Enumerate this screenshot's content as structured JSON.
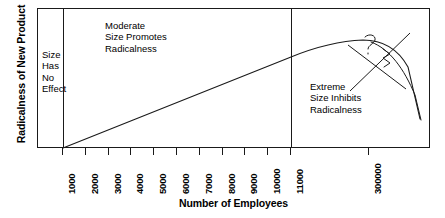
{
  "chart_data": {
    "type": "line",
    "title": "",
    "xlabel": "Number of Employees",
    "ylabel": "Radicalness of New Product",
    "grid": false,
    "legend": null,
    "x_tick_labels": [
      "1000",
      "2000",
      "3000",
      "4000",
      "5000",
      "6000",
      "7000",
      "8000",
      "9000",
      "10000",
      "11000",
      "300000"
    ],
    "y_tick_labels": [],
    "x_scale": "ordinal-break",
    "series": [
      {
        "name": "Radicalness vs firm size",
        "description": "Flat at zero below 1000 employees, rises linearly to a broad peak near 300000 employees, then falls steeply",
        "points": [
          {
            "x": "1000",
            "y": 0
          },
          {
            "x": "2000",
            "y": 8
          },
          {
            "x": "3000",
            "y": 17
          },
          {
            "x": "4000",
            "y": 26
          },
          {
            "x": "5000",
            "y": 35
          },
          {
            "x": "6000",
            "y": 43
          },
          {
            "x": "7000",
            "y": 52
          },
          {
            "x": "8000",
            "y": 61
          },
          {
            "x": "9000",
            "y": 70
          },
          {
            "x": "10000",
            "y": 78
          },
          {
            "x": "11000",
            "y": 84
          },
          {
            "x": "300000",
            "y": 92
          }
        ]
      }
    ],
    "regions": [
      {
        "id": "left",
        "boundary_low": null,
        "boundary_high": "1000",
        "label": "Size Has No Effect"
      },
      {
        "id": "mid",
        "boundary_low": "1000",
        "boundary_high": "11000",
        "label": "Moderate Size Promotes Radicalness"
      },
      {
        "id": "right",
        "boundary_low": "11000",
        "boundary_high": null,
        "label": "Extreme Size Inhibits Radicalness"
      }
    ],
    "annotations": [
      {
        "type": "question-mark",
        "text": "?",
        "note": "hand-drawn question mark near curve peak"
      },
      {
        "type": "cross-out",
        "text": "",
        "note": "two crossing hand-drawn diagonal strokes over the descending branch"
      }
    ]
  },
  "axes": {
    "y_title": "Radicalness of New Product",
    "x_title": "Number of Employees"
  },
  "zones": {
    "left": {
      "line1": "Size",
      "line2": "Has",
      "line3": "No",
      "line4": "Effect"
    },
    "mid": {
      "line1": "Moderate",
      "line2": "Size Promotes",
      "line3": "Radicalness"
    },
    "right": {
      "line1": "Extreme",
      "line2": "Size Inhibits",
      "line3": "Radicalness"
    }
  },
  "ticks": [
    {
      "label": "1000"
    },
    {
      "label": "2000"
    },
    {
      "label": "3000"
    },
    {
      "label": "4000"
    },
    {
      "label": "5000"
    },
    {
      "label": "6000"
    },
    {
      "label": "7000"
    },
    {
      "label": "8000"
    },
    {
      "label": "9000"
    },
    {
      "label": "10000"
    },
    {
      "label": "11000"
    },
    {
      "label": "300000"
    }
  ],
  "colors": {
    "line": "#1a1a1a",
    "frame": "#1a1a1a",
    "text": "#000000",
    "background": "#ffffff"
  }
}
